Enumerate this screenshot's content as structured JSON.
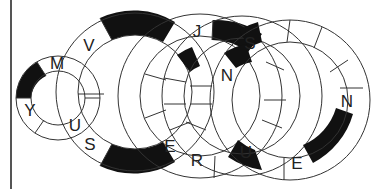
{
  "puzzle": {
    "type": "interlocking word rings",
    "rings": [
      {
        "id": "ring-1",
        "cx": 58,
        "cy": 98,
        "ro": 42,
        "ri": 27,
        "segments": 8,
        "letters": [
          {
            "ch": "M",
            "angle": -110
          },
          {
            "ch": "Y",
            "angle": 155
          },
          {
            "ch": "U",
            "angle": 60
          }
        ],
        "black": [
          [
            190,
            235
          ]
        ]
      },
      {
        "id": "ring-2",
        "cx": 135,
        "cy": 92,
        "ro": 79,
        "ri": 57,
        "segments": 14,
        "letters": [
          {
            "ch": "V",
            "angle": -120
          },
          {
            "ch": "S",
            "angle": 120
          }
        ],
        "black": [
          [
            -105,
            -50
          ],
          [
            50,
            105
          ]
        ]
      },
      {
        "id": "ring-3",
        "cx": 200,
        "cy": 96,
        "ro": 82,
        "ri": 60,
        "segments": 16,
        "letters": [
          {
            "ch": "J",
            "angle": -80
          },
          {
            "ch": "E",
            "angle": 105
          },
          {
            "ch": "R",
            "angle": 95
          }
        ],
        "black": [
          [
            -70,
            -45
          ]
        ]
      },
      {
        "id": "ring-4",
        "cx": 242,
        "cy": 96,
        "ro": 80,
        "ri": 58,
        "segments": 16,
        "letters": [
          {
            "ch": "S",
            "angle": -80
          },
          {
            "ch": "N",
            "angle": -115
          },
          {
            "ch": "U",
            "angle": 90
          }
        ],
        "black": [
          [
            -100,
            -80
          ],
          [
            -150,
            -120
          ]
        ]
      },
      {
        "id": "ring-5",
        "cx": 290,
        "cy": 100,
        "ro": 80,
        "ri": 58,
        "segments": 14,
        "letters": [
          {
            "ch": "N",
            "angle": 5
          },
          {
            "ch": "E",
            "angle": 95
          }
        ],
        "black": [
          [
            20,
            70
          ]
        ]
      }
    ],
    "visible_letters": [
      "M",
      "V",
      "J",
      "S",
      "N",
      "Y",
      "U",
      "S",
      "E",
      "R",
      "U",
      "E",
      "N"
    ]
  },
  "colors": {
    "line": "#333333",
    "fill_black": "#111111",
    "background": "#ffffff"
  }
}
